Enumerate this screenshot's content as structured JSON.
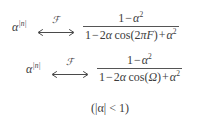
{
  "document": {
    "kind": "math-equation-block",
    "description": "Fourier transform pair for two-sided exponential sequence",
    "text_color": "#3c3c3c",
    "background_color": "#ffffff",
    "rule_color": "#555555"
  },
  "equations": [
    {
      "id": "pair-continuous-frequency",
      "lhs_base": "α",
      "lhs_exponent": "|n|",
      "operator_symbol": "⟷",
      "operator_label": "ℱ",
      "numerator": {
        "text": "1 − α²",
        "parts": [
          {
            "t": "1"
          },
          {
            "t": "−",
            "op": true
          },
          {
            "t": "α",
            "var": true
          },
          {
            "t": "2",
            "sup": true
          }
        ]
      },
      "denominator": {
        "text": "1 − 2α cos(2πF) + α²",
        "parts": [
          {
            "t": "1"
          },
          {
            "t": "−",
            "op": true
          },
          {
            "t": "2"
          },
          {
            "t": "α",
            "var": true
          },
          {
            "t": "cos(2"
          },
          {
            "t": "π",
            "var": true
          },
          {
            "t": "F",
            "var": true
          },
          {
            "t": ")"
          },
          {
            "t": "+",
            "op": true
          },
          {
            "t": "α",
            "var": true
          },
          {
            "t": "2",
            "sup": true
          }
        ]
      }
    },
    {
      "id": "pair-radian-frequency",
      "lhs_base": "α",
      "lhs_exponent": "|n|",
      "operator_symbol": "⟷",
      "operator_label": "ℱ",
      "numerator": {
        "text": "1 − α²",
        "parts": [
          {
            "t": "1"
          },
          {
            "t": "−",
            "op": true
          },
          {
            "t": "α",
            "var": true
          },
          {
            "t": "2",
            "sup": true
          }
        ]
      },
      "denominator": {
        "text": "1 − 2α cos(Ω) + α²",
        "parts": [
          {
            "t": "1"
          },
          {
            "t": "−",
            "op": true
          },
          {
            "t": "2"
          },
          {
            "t": "α",
            "var": true
          },
          {
            "t": "cos("
          },
          {
            "t": "Ω",
            "var": true
          },
          {
            "t": ")"
          },
          {
            "t": "+",
            "op": true
          },
          {
            "t": "α",
            "var": true
          },
          {
            "t": "2",
            "sup": true
          }
        ]
      }
    }
  ],
  "condition": {
    "text": "(|α| < 1)",
    "open_paren": "(|",
    "variable": "α",
    "close": "| < 1)"
  }
}
